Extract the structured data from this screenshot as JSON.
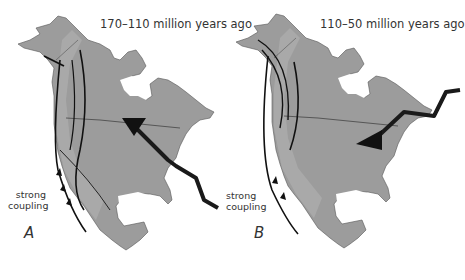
{
  "figure": {
    "panels": [
      {
        "id": "A",
        "letter": "A",
        "title": "170–110 million years ago",
        "annotation_line1": "strong",
        "annotation_line2": "coupling",
        "slab_arrow_direction": "down-into-interior"
      },
      {
        "id": "B",
        "letter": "B",
        "title": "110–50 million years ago",
        "annotation_line1": "strong",
        "annotation_line2": "coupling",
        "slab_arrow_direction": "west-into-interior"
      }
    ],
    "colors": {
      "land": "#9a9a9a",
      "land_dark_band": "#8a8a8a",
      "land_light_band": "#b0b0b0",
      "lines": "#1a1a1a",
      "text": "#333333",
      "background": "#ffffff"
    }
  }
}
